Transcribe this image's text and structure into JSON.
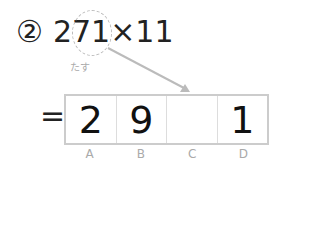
{
  "problem": {
    "number_label": "②",
    "expression_prefix": "2",
    "highlighted": "71",
    "expression_suffix": "×11"
  },
  "hint": "たす",
  "equals": "=",
  "answer_cells": [
    {
      "label": "A",
      "value": "2"
    },
    {
      "label": "B",
      "value": "9"
    },
    {
      "label": "C",
      "value": ""
    },
    {
      "label": "D",
      "value": "1"
    }
  ]
}
